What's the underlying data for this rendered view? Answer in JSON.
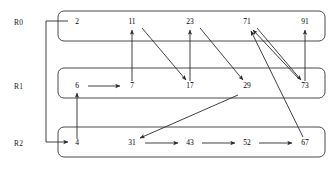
{
  "diagram": {
    "background_color": "#ffffff",
    "box_stroke_color": "#4a4a4a",
    "edge_color": "#2b2b2b",
    "text_color": "#000000",
    "rows": [
      {
        "id": "R0",
        "label": "R0",
        "label_x": 14,
        "label_y": 25,
        "box": {
          "x": 58,
          "y": 11,
          "width": 267,
          "height": 30,
          "rx": 6
        },
        "nodes": [
          {
            "name": "r0-n0",
            "value": "2",
            "x": 77,
            "y": 24
          },
          {
            "name": "r0-n1",
            "value": "11",
            "x": 132,
            "y": 24
          },
          {
            "name": "r0-n2",
            "value": "23",
            "x": 190,
            "y": 24
          },
          {
            "name": "r0-n3",
            "value": "71",
            "x": 247,
            "y": 24
          },
          {
            "name": "r0-n4",
            "value": "91",
            "x": 305,
            "y": 24
          }
        ]
      },
      {
        "id": "R1",
        "label": "R1",
        "label_x": 14,
        "label_y": 89,
        "box": {
          "x": 58,
          "y": 68,
          "width": 267,
          "height": 30,
          "rx": 6
        },
        "nodes": [
          {
            "name": "r1-n0",
            "value": "6",
            "x": 77,
            "y": 88
          },
          {
            "name": "r1-n1",
            "value": "7",
            "x": 132,
            "y": 88
          },
          {
            "name": "r1-n2",
            "value": "17",
            "x": 190,
            "y": 88
          },
          {
            "name": "r1-n3",
            "value": "29",
            "x": 247,
            "y": 88
          },
          {
            "name": "r1-n4",
            "value": "73",
            "x": 305,
            "y": 88
          }
        ]
      },
      {
        "id": "R2",
        "label": "R2",
        "label_x": 14,
        "label_y": 146,
        "box": {
          "x": 58,
          "y": 127,
          "width": 267,
          "height": 30,
          "rx": 6
        },
        "nodes": [
          {
            "name": "r2-n0",
            "value": "4",
            "x": 77,
            "y": 145
          },
          {
            "name": "r2-n1",
            "value": "31",
            "x": 132,
            "y": 145
          },
          {
            "name": "r2-n2",
            "value": "43",
            "x": 190,
            "y": 145
          },
          {
            "name": "r2-n3",
            "value": "52",
            "x": 247,
            "y": 145
          },
          {
            "name": "r2-n4",
            "value": "67",
            "x": 305,
            "y": 145
          }
        ]
      }
    ],
    "edges": [
      {
        "name": "edge-2-to-4",
        "from": "2",
        "to": "4",
        "kind": "routed",
        "path": "M 68 21 L 46 21 L 46 142 L 68 142"
      },
      {
        "name": "edge-4-to-6",
        "from": "4",
        "to": "6",
        "kind": "straight",
        "path": "M 77 139 L 77 93"
      },
      {
        "name": "edge-6-to-7",
        "from": "6",
        "to": "7",
        "kind": "straight",
        "path": "M 88 86 L 120 86"
      },
      {
        "name": "edge-7-to-11",
        "from": "7",
        "to": "11",
        "kind": "straight",
        "path": "M 132 81 L 132 30"
      },
      {
        "name": "edge-11-to-17",
        "from": "11",
        "to": "17",
        "kind": "diagonal",
        "path": "M 142 28 L 186 80"
      },
      {
        "name": "edge-17-to-23",
        "from": "17",
        "to": "23",
        "kind": "straight",
        "path": "M 190 81 L 190 30"
      },
      {
        "name": "edge-23-to-29",
        "from": "23",
        "to": "29",
        "kind": "diagonal",
        "path": "M 200 28 L 243 80"
      },
      {
        "name": "edge-29-to-31",
        "from": "29",
        "to": "31",
        "kind": "diagonal",
        "path": "M 238 95 L 140 138"
      },
      {
        "name": "edge-31-to-43",
        "from": "31",
        "to": "43",
        "kind": "straight",
        "path": "M 145 143 L 178 143"
      },
      {
        "name": "edge-43-to-52",
        "from": "43",
        "to": "52",
        "kind": "straight",
        "path": "M 202 143 L 235 143"
      },
      {
        "name": "edge-52-to-67",
        "from": "52",
        "to": "67",
        "kind": "straight",
        "path": "M 259 143 L 292 143"
      },
      {
        "name": "edge-67-to-71",
        "from": "67",
        "to": "71",
        "kind": "diagonal",
        "path": "M 303 137 L 251 31"
      },
      {
        "name": "edge-71-to-73",
        "from": "71",
        "to": "73",
        "kind": "diagonal",
        "path": "M 257 28 L 301 80"
      },
      {
        "name": "edge-73-to-91",
        "from": "73",
        "to": "91",
        "kind": "straight",
        "path": "M 305 81 L 305 30"
      },
      {
        "name": "edge-73-to-71",
        "from": "73",
        "to": "71",
        "kind": "diagonal",
        "path": "M 299 79 L 253 30"
      }
    ]
  }
}
